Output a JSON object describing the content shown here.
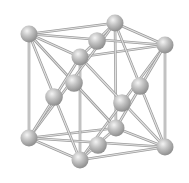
{
  "diagram": {
    "structure": "FCC",
    "atom_count": 14,
    "colors": {
      "background": "#ffffff",
      "atom_base": "#b4b4b4",
      "atom_highlight": "#f2f2f2",
      "atom_shadow": "#8a8a8a",
      "bond": "#c4c4c4",
      "bond_edge": "#9c9c9c"
    },
    "atoms": [
      {
        "id": "corner-top-back-left",
        "type": "corner"
      },
      {
        "id": "corner-top-back-right",
        "type": "corner"
      },
      {
        "id": "corner-top-front-right",
        "type": "corner"
      },
      {
        "id": "corner-top-front-left",
        "type": "corner"
      },
      {
        "id": "corner-bottom-back-left",
        "type": "corner"
      },
      {
        "id": "corner-bottom-back-right",
        "type": "corner"
      },
      {
        "id": "corner-bottom-front-right",
        "type": "corner"
      },
      {
        "id": "corner-bottom-front-left",
        "type": "corner"
      },
      {
        "id": "face-top",
        "type": "face-center"
      },
      {
        "id": "face-bottom",
        "type": "face-center"
      },
      {
        "id": "face-front",
        "type": "face-center"
      },
      {
        "id": "face-back",
        "type": "face-center"
      },
      {
        "id": "face-left",
        "type": "face-center"
      },
      {
        "id": "face-right",
        "type": "face-center"
      }
    ]
  }
}
